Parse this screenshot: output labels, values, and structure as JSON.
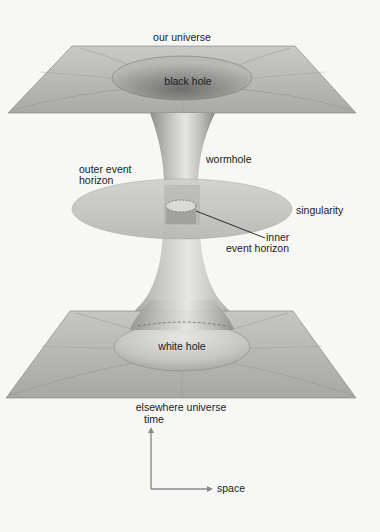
{
  "diagram": {
    "labels": {
      "our_universe": "our universe",
      "black_hole": "black hole",
      "wormhole": "wormhole",
      "outer_event_horizon_line1": "outer event",
      "outer_event_horizon_line2": "horizon",
      "singularity": "singularity",
      "inner_event_horizon_line1": "inner",
      "inner_event_horizon_line2": "event horizon",
      "white_hole": "white hole",
      "elsewhere_universe": "elsewhere universe"
    },
    "axes": {
      "vertical": "time",
      "horizontal": "space"
    },
    "colors": {
      "background": "#f7f7f5",
      "plane": "#b8b8b6",
      "plane_dark": "#8e8e8c",
      "throat_light": "#e2e2e0",
      "throat_dark": "#9a9a98",
      "disc": "#c4c4c2",
      "text": "#1a1a1a",
      "axis": "#8a8a8a"
    }
  }
}
